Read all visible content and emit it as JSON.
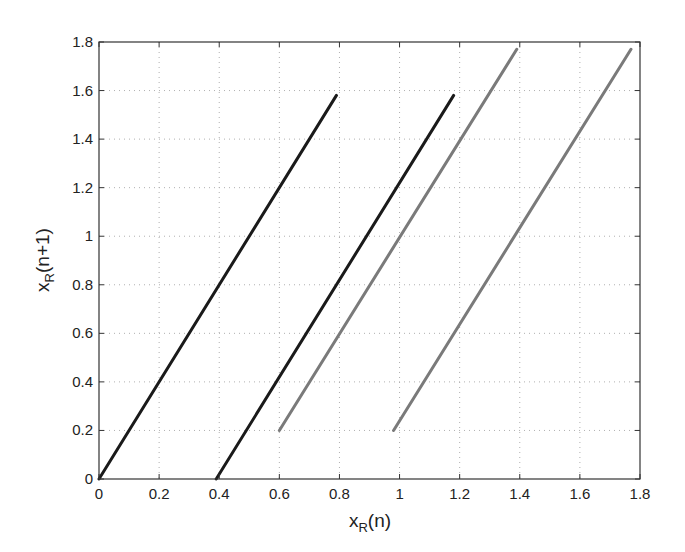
{
  "chart_data": {
    "type": "line",
    "title": "",
    "xlabel": "x_R(n)",
    "ylabel": "x_R(n+1)",
    "xlabel_parts": {
      "base": "x",
      "sub": "R",
      "rest": "(n)"
    },
    "ylabel_parts": {
      "base": "x",
      "sub": "R",
      "rest": "(n+1)"
    },
    "xlim": [
      0,
      1.8
    ],
    "ylim": [
      0,
      1.8
    ],
    "x_ticks": [
      0,
      0.2,
      0.4,
      0.6,
      0.8,
      1,
      1.2,
      1.4,
      1.6,
      1.8
    ],
    "y_ticks": [
      0,
      0.2,
      0.4,
      0.6,
      0.8,
      1,
      1.2,
      1.4,
      1.6,
      1.8
    ],
    "x_tick_labels": [
      "0",
      "0.2",
      "0.4",
      "0.6",
      "0.8",
      "1",
      "1.2",
      "1.4",
      "1.6",
      "1.8"
    ],
    "y_tick_labels": [
      "0",
      "0.2",
      "0.4",
      "0.6",
      "0.8",
      "1",
      "1.2",
      "1.4",
      "1.6",
      "1.8"
    ],
    "grid": true,
    "legend": null,
    "series": [
      {
        "name": "branch-1",
        "color": "#1a1a1a",
        "x": [
          0,
          0.79
        ],
        "y": [
          0,
          1.58
        ]
      },
      {
        "name": "branch-2",
        "color": "#1a1a1a",
        "x": [
          0.39,
          1.18
        ],
        "y": [
          0,
          1.58
        ]
      },
      {
        "name": "branch-3",
        "color": "#7a7a7a",
        "x": [
          0.6,
          1.39
        ],
        "y": [
          0.2,
          1.77
        ]
      },
      {
        "name": "branch-4",
        "color": "#7a7a7a",
        "x": [
          0.98,
          1.77
        ],
        "y": [
          0.2,
          1.77
        ]
      }
    ]
  },
  "colors": {
    "axis": "#333333",
    "grid": "#b0b0b0",
    "background": "#ffffff"
  }
}
